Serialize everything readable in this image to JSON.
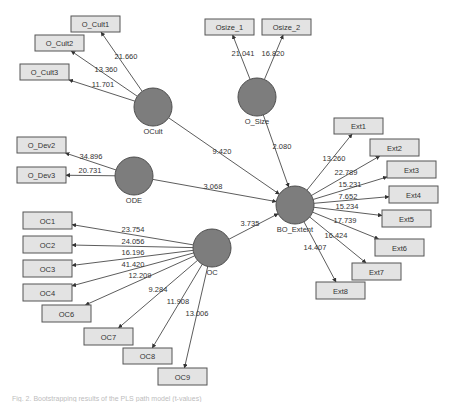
{
  "diagram": {
    "title": "",
    "constructs": [
      {
        "id": "OCult",
        "label": "OCult",
        "cx": 153,
        "cy": 107,
        "r": 19
      },
      {
        "id": "O_Size",
        "label": "O_Size",
        "cx": 257,
        "cy": 97,
        "r": 19
      },
      {
        "id": "ODE",
        "label": "ODE",
        "cx": 134,
        "cy": 176,
        "r": 19
      },
      {
        "id": "OC",
        "label": "OC",
        "cx": 212,
        "cy": 248,
        "r": 19
      },
      {
        "id": "BO_Extent",
        "label": "BO_Extent",
        "cx": 295,
        "cy": 205,
        "r": 19
      }
    ],
    "indicators": [
      {
        "id": "O_Cult1",
        "label": "O_Cult1",
        "x": 71,
        "y": 16,
        "w": 49,
        "h": 16
      },
      {
        "id": "O_Cult2",
        "label": "O_Cult2",
        "x": 35,
        "y": 35,
        "w": 49,
        "h": 16
      },
      {
        "id": "O_Cult3",
        "label": "O_Cult3",
        "x": 20,
        "y": 64,
        "w": 49,
        "h": 16
      },
      {
        "id": "Osize_1",
        "label": "Osize_1",
        "x": 205,
        "y": 19,
        "w": 49,
        "h": 16
      },
      {
        "id": "Osize_2",
        "label": "Osize_2",
        "x": 262,
        "y": 19,
        "w": 49,
        "h": 16
      },
      {
        "id": "O_Dev2",
        "label": "O_Dev2",
        "x": 17,
        "y": 137,
        "w": 49,
        "h": 16
      },
      {
        "id": "O_Dev3",
        "label": "O_Dev3",
        "x": 17,
        "y": 167,
        "w": 49,
        "h": 16
      },
      {
        "id": "OC1",
        "label": "OC1",
        "x": 23,
        "y": 212,
        "w": 49,
        "h": 17
      },
      {
        "id": "OC2",
        "label": "OC2",
        "x": 23,
        "y": 236,
        "w": 49,
        "h": 17
      },
      {
        "id": "OC3",
        "label": "OC3",
        "x": 23,
        "y": 260,
        "w": 49,
        "h": 17
      },
      {
        "id": "OC4",
        "label": "OC4",
        "x": 23,
        "y": 284,
        "w": 49,
        "h": 17
      },
      {
        "id": "OC6",
        "label": "OC6",
        "x": 42,
        "y": 305,
        "w": 49,
        "h": 17
      },
      {
        "id": "OC7",
        "label": "OC7",
        "x": 84,
        "y": 328,
        "w": 49,
        "h": 17
      },
      {
        "id": "OC8",
        "label": "OC8",
        "x": 123,
        "y": 348,
        "w": 49,
        "h": 16
      },
      {
        "id": "OC9",
        "label": "OC9",
        "x": 158,
        "y": 368,
        "w": 49,
        "h": 17
      },
      {
        "id": "Ext1",
        "label": "Ext1",
        "x": 334,
        "y": 118,
        "w": 49,
        "h": 16
      },
      {
        "id": "Ext2",
        "label": "Ext2",
        "x": 370,
        "y": 139,
        "w": 49,
        "h": 17
      },
      {
        "id": "Ext3",
        "label": "Ext3",
        "x": 387,
        "y": 161,
        "w": 49,
        "h": 17
      },
      {
        "id": "Ext4",
        "label": "Ext4",
        "x": 389,
        "y": 186,
        "w": 49,
        "h": 17
      },
      {
        "id": "Ext5",
        "label": "Ext5",
        "x": 382,
        "y": 210,
        "w": 49,
        "h": 17
      },
      {
        "id": "Ext6",
        "label": "Ext6",
        "x": 375,
        "y": 239,
        "w": 49,
        "h": 17
      },
      {
        "id": "Ext7",
        "label": "Ext7",
        "x": 352,
        "y": 263,
        "w": 49,
        "h": 17
      },
      {
        "id": "Ext8",
        "label": "Ext8",
        "x": 316,
        "y": 282,
        "w": 49,
        "h": 17
      }
    ],
    "measurement_paths": [
      {
        "from": "OCult",
        "to": "O_Cult1",
        "value": "21.660",
        "lx": 126,
        "ly": 59
      },
      {
        "from": "OCult",
        "to": "O_Cult2",
        "value": "13.360",
        "lx": 106,
        "ly": 72
      },
      {
        "from": "OCult",
        "to": "O_Cult3",
        "value": "11.701",
        "lx": 103,
        "ly": 87
      },
      {
        "from": "O_Size",
        "to": "Osize_1",
        "value": "21.041",
        "lx": 243,
        "ly": 56
      },
      {
        "from": "O_Size",
        "to": "Osize_2",
        "value": "16.820",
        "lx": 273,
        "ly": 56
      },
      {
        "from": "ODE",
        "to": "O_Dev2",
        "value": "34.896",
        "lx": 91,
        "ly": 159
      },
      {
        "from": "ODE",
        "to": "O_Dev3",
        "value": "20.731",
        "lx": 90,
        "ly": 173
      },
      {
        "from": "OC",
        "to": "OC1",
        "value": "23.754",
        "lx": 133,
        "ly": 232
      },
      {
        "from": "OC",
        "to": "OC2",
        "value": "24.056",
        "lx": 133,
        "ly": 244
      },
      {
        "from": "OC",
        "to": "OC3",
        "value": "16.196",
        "lx": 133,
        "ly": 255
      },
      {
        "from": "OC",
        "to": "OC4",
        "value": "41.420",
        "lx": 133,
        "ly": 267
      },
      {
        "from": "OC",
        "to": "OC6",
        "value": "12.209",
        "lx": 140,
        "ly": 278
      },
      {
        "from": "OC",
        "to": "OC7",
        "value": "9.284",
        "lx": 158,
        "ly": 292
      },
      {
        "from": "OC",
        "to": "OC8",
        "value": "11.908",
        "lx": 178,
        "ly": 304
      },
      {
        "from": "OC",
        "to": "OC9",
        "value": "13.006",
        "lx": 197,
        "ly": 316
      },
      {
        "from": "BO_Extent",
        "to": "Ext1",
        "value": "13.260",
        "lx": 334,
        "ly": 161
      },
      {
        "from": "BO_Extent",
        "to": "Ext2",
        "value": "22.789",
        "lx": 346,
        "ly": 175
      },
      {
        "from": "BO_Extent",
        "to": "Ext3",
        "value": "15.231",
        "lx": 350,
        "ly": 187
      },
      {
        "from": "BO_Extent",
        "to": "Ext4",
        "value": "7.652",
        "lx": 348,
        "ly": 199
      },
      {
        "from": "BO_Extent",
        "to": "Ext5",
        "value": "15.234",
        "lx": 347,
        "ly": 209
      },
      {
        "from": "BO_Extent",
        "to": "Ext6",
        "value": "17.739",
        "lx": 345,
        "ly": 223
      },
      {
        "from": "BO_Extent",
        "to": "Ext7",
        "value": "16.424",
        "lx": 336,
        "ly": 238
      },
      {
        "from": "BO_Extent",
        "to": "Ext8",
        "value": "14.407",
        "lx": 315,
        "ly": 250
      }
    ],
    "structural_paths": [
      {
        "from": "OCult",
        "to": "BO_Extent",
        "value": "9.420",
        "lx": 222,
        "ly": 154
      },
      {
        "from": "O_Size",
        "to": "BO_Extent",
        "value": "2.080",
        "lx": 282,
        "ly": 149
      },
      {
        "from": "ODE",
        "to": "BO_Extent",
        "value": "3.068",
        "lx": 213,
        "ly": 189
      },
      {
        "from": "OC",
        "to": "BO_Extent",
        "value": "3.735",
        "lx": 250,
        "ly": 226
      }
    ],
    "colors": {
      "construct_fill": "#7d7d7d",
      "indicator_fill": "#e3e3e3",
      "edge": "#4a4a4a"
    }
  },
  "caption": "Fig. 2. Bootstrapping results of the PLS path model (t-values)"
}
